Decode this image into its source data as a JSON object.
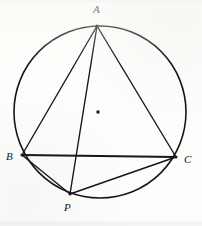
{
  "figure": {
    "background_color": "#fdfdfb",
    "stroke_color": "#17171b",
    "canvas": {
      "width": 202,
      "height": 226
    }
  },
  "circle": {
    "name": "circumscribed-circle",
    "center": {
      "x": 100,
      "y": 112
    },
    "radius": 86,
    "stroke_width": 1.6
  },
  "center_point": {
    "name": "circle-center-dot",
    "x": 98,
    "y": 112,
    "size": 3
  },
  "points": [
    {
      "id": "A",
      "label": "A",
      "x": 97,
      "y": 26,
      "label_x": 93,
      "label_y": 4
    },
    {
      "id": "B",
      "label": "B",
      "x": 22,
      "y": 155,
      "label_x": 6,
      "label_y": 151
    },
    {
      "id": "C",
      "label": "C",
      "x": 176,
      "y": 157,
      "label_x": 184,
      "label_y": 154
    },
    {
      "id": "P",
      "label": "P",
      "x": 70,
      "y": 194,
      "label_x": 64,
      "label_y": 202
    }
  ],
  "segments": [
    {
      "name": "segment-AB",
      "from": "A",
      "to": "B",
      "stroke_width": 1.4
    },
    {
      "name": "segment-AC",
      "from": "A",
      "to": "C",
      "stroke_width": 1.4
    },
    {
      "name": "segment-AP",
      "from": "A",
      "to": "P",
      "stroke_width": 1.4
    },
    {
      "name": "segment-BC",
      "from": "B",
      "to": "C",
      "stroke_width": 1.8
    },
    {
      "name": "segment-BP",
      "from": "B",
      "to": "P",
      "stroke_width": 1.4
    },
    {
      "name": "segment-PC",
      "from": "P",
      "to": "C",
      "stroke_width": 1.6
    }
  ]
}
